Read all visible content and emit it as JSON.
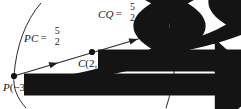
{
  "figure": {
    "name": "vector-addition-collinear-points",
    "background": "#ffffff",
    "ink": "#141414",
    "width": 241,
    "height": 109
  },
  "points": [
    {
      "id": "P",
      "name": "P",
      "label": "P",
      "coords": "(−3, 2)",
      "x": 14,
      "y": 76
    },
    {
      "id": "C",
      "name": "C",
      "label": "C",
      "coords": "(2, 4)",
      "x": 92,
      "y": 52
    },
    {
      "id": "Q",
      "name": "Q",
      "label": "Q",
      "coords": "(2 + 5, 4 + 2)",
      "x": 175,
      "y": 28
    }
  ],
  "vectors": [
    {
      "id": "PC",
      "name": "PC",
      "label": "PC",
      "components": {
        "x": "5",
        "y": "2"
      },
      "equals": "=",
      "from": "P",
      "to": "C"
    },
    {
      "id": "CQ",
      "name": "CQ",
      "label": "CQ",
      "components": {
        "x": "5",
        "y": "2"
      },
      "equals": "=",
      "from": "C",
      "to": "Q"
    }
  ],
  "arcs": [
    {
      "id": "left-arc",
      "name": "left-bracket-arc",
      "through": "P"
    },
    {
      "id": "right-arc",
      "name": "right-bracket-arc",
      "through": "Q"
    }
  ]
}
